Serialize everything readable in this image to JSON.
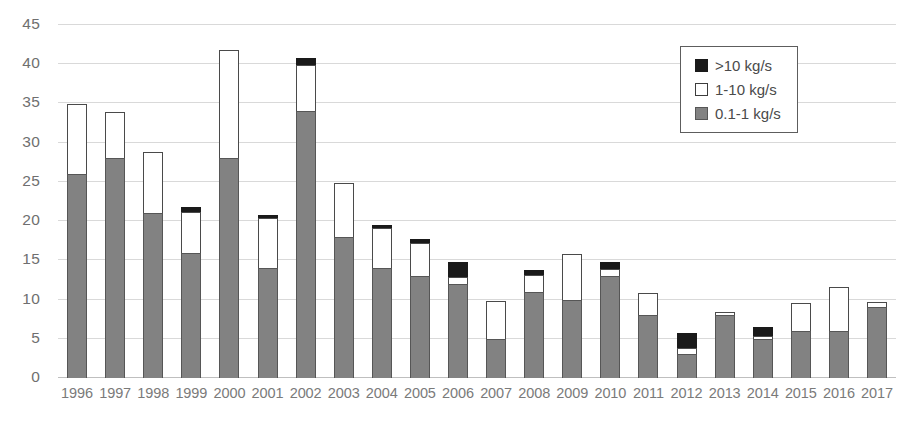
{
  "chart_data": {
    "type": "bar",
    "title": "",
    "xlabel": "",
    "ylabel": "",
    "grid": true,
    "stacked": true,
    "legend_position": "top-right",
    "ylim": [
      0,
      45
    ],
    "yticks": [
      0,
      5,
      10,
      15,
      20,
      25,
      30,
      35,
      40,
      45
    ],
    "ytick_labels": [
      "0",
      "5",
      "10",
      "15",
      "20",
      "25",
      "30",
      "35",
      "40",
      "45"
    ],
    "categories": [
      "1996",
      "1997",
      "1998",
      "1999",
      "2000",
      "2001",
      "2002",
      "2003",
      "2004",
      "2005",
      "2006",
      "2007",
      "2008",
      "2009",
      "2010",
      "2011",
      "2012",
      "2013",
      "2014",
      "2015",
      "2016",
      "2017"
    ],
    "series": [
      {
        "name": "0.1-1 kg/s",
        "color": "#828282",
        "values": [
          26,
          28,
          21,
          16,
          28,
          14,
          34,
          18,
          14,
          13,
          12,
          5,
          11,
          10,
          13,
          8,
          3,
          8,
          5,
          6,
          6,
          9
        ]
      },
      {
        "name": "1-10 kg/s",
        "color": "#ffffff",
        "values": [
          9,
          6,
          8,
          5.3,
          14,
          6.5,
          6,
          7,
          5.2,
          4.3,
          1,
          5,
          2.3,
          6,
          1,
          3,
          1,
          0.5,
          0.5,
          3.7,
          5.7,
          0.8
        ]
      },
      {
        "name": ">10 kg/s",
        "color": "#1a1a1a",
        "values": [
          0,
          0,
          0,
          0.7,
          0,
          0.5,
          1,
          0,
          0.6,
          0.7,
          2,
          0,
          0.7,
          0,
          1,
          0,
          2,
          0,
          1.2,
          0,
          0,
          0
        ]
      }
    ],
    "totals": [
      35,
      34,
      29,
      22,
      42,
      21,
      41,
      25,
      19.8,
      18,
      15,
      10,
      14,
      16,
      15,
      11,
      6,
      8.5,
      6.7,
      9.7,
      11.7,
      9.8
    ]
  },
  "legend": {
    "items": [
      {
        "label": ">10 kg/s",
        "swatch": "black-square-icon"
      },
      {
        "label": "1-10 kg/s",
        "swatch": "white-square-icon"
      },
      {
        "label": "0.1-1 kg/s",
        "swatch": "gray-square-icon"
      }
    ]
  }
}
